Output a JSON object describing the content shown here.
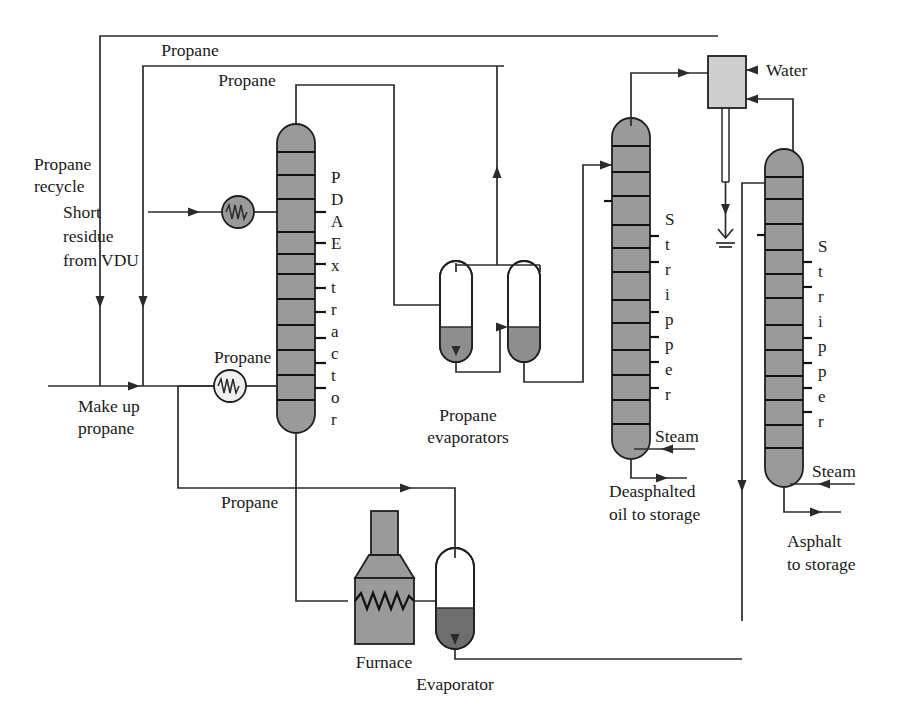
{
  "diagram": {
    "type": "process-flow-diagram",
    "colors": {
      "line": "#2b2b2b",
      "vessel_fill_dark": "#9a9a9a",
      "vessel_fill_light": "#d0d0d0",
      "liquid_fill": "#8e8e8e",
      "background": "#ffffff"
    }
  },
  "labels": {
    "propane_recycle": "Propane\nrecycle",
    "propane_recycle_line1": "Propane",
    "propane_recycle_line2": "recycle",
    "propane_top": "Propane",
    "propane_second": "Propane",
    "propane_extractor_feed": "Propane",
    "propane_bottom": "Propane",
    "short_residue_line1": "Short",
    "short_residue_line2": "residue",
    "short_residue_line3": "from VDU",
    "make_up_propane_line1": "Make up",
    "make_up_propane_line2": "propane",
    "water": "Water",
    "propane_evaporators_line1": "Propane",
    "propane_evaporators_line2": "evaporators",
    "steam_left": "Steam",
    "steam_right": "Steam",
    "deasphalted_oil_line1": "Deasphalted",
    "deasphalted_oil_line2": "oil to storage",
    "asphalt_line1": "Asphalt",
    "asphalt_line2": "to storage",
    "furnace": "Furnace",
    "evaporator": "Evaporator"
  },
  "vessels": {
    "pda_extractor": {
      "name": "PDA Extractor",
      "letters": [
        "P",
        "D",
        "A",
        "E",
        "x",
        "t",
        "r",
        "a",
        "c",
        "t",
        "o",
        "r"
      ]
    },
    "stripper_left": {
      "name": "Stripper",
      "letters": [
        "S",
        "t",
        "r",
        "i",
        "p",
        "p",
        "e",
        "r"
      ]
    },
    "stripper_right": {
      "name": "Stripper",
      "letters": [
        "S",
        "t",
        "r",
        "i",
        "p",
        "p",
        "e",
        "r"
      ]
    },
    "evaporator_left": {
      "name": "Propane evaporator 1"
    },
    "evaporator_right": {
      "name": "Propane evaporator 2"
    },
    "evaporator_bottom": {
      "name": "Evaporator"
    },
    "furnace": {
      "name": "Furnace"
    },
    "water_separator": {
      "name": "Water separator"
    }
  },
  "equipment_icons": {
    "heat_exchanger_feed": "heat-exchanger-icon",
    "heat_exchanger_propane": "heat-exchanger-icon",
    "furnace_coil": "furnace-coil-icon",
    "drain": "drain-icon"
  }
}
